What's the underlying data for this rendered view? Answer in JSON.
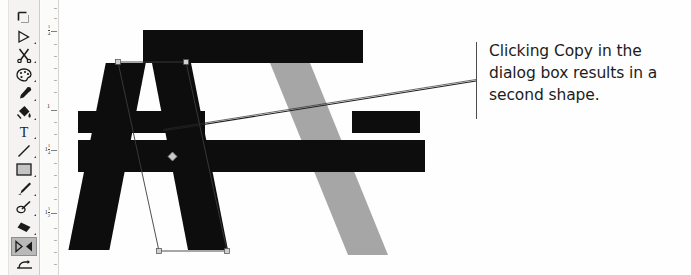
{
  "app": {
    "name": "image-editor-canvas"
  },
  "toolbox": {
    "tools": [
      {
        "id": "crop",
        "icon_name": "crop-icon",
        "label": "Crop",
        "selected": false,
        "has_flyout": false
      },
      {
        "id": "select-shape",
        "icon_name": "pointer-triangle-icon",
        "label": "Shape Select",
        "selected": false,
        "has_flyout": true
      },
      {
        "id": "scissors",
        "icon_name": "scissors-icon",
        "label": "Scissors",
        "selected": false,
        "has_flyout": true
      },
      {
        "id": "palette",
        "icon_name": "palette-icon",
        "label": "Palette",
        "selected": false,
        "has_flyout": true
      },
      {
        "id": "eyedropper",
        "icon_name": "eyedropper-icon",
        "label": "Eyedropper",
        "selected": false,
        "has_flyout": true
      },
      {
        "id": "paint-bucket",
        "icon_name": "paint-bucket-icon",
        "label": "Paint Bucket",
        "selected": false,
        "has_flyout": true
      },
      {
        "id": "text",
        "icon_name": "text-tool-icon",
        "label": "Text",
        "selected": false,
        "has_flyout": true
      },
      {
        "id": "line",
        "icon_name": "line-tool-icon",
        "label": "Line",
        "selected": false,
        "has_flyout": true
      },
      {
        "id": "rectangle",
        "icon_name": "rectangle-tool-icon",
        "label": "Rectangle",
        "selected": false,
        "has_flyout": true
      },
      {
        "id": "brush",
        "icon_name": "paintbrush-icon",
        "label": "Brush",
        "selected": false,
        "has_flyout": true
      },
      {
        "id": "pencil-eraser",
        "icon_name": "pencil-eraser-icon",
        "label": "Pencil",
        "selected": false,
        "has_flyout": true
      },
      {
        "id": "eraser",
        "icon_name": "eraser-icon",
        "label": "Eraser",
        "selected": false,
        "has_flyout": true
      },
      {
        "id": "flip-mirror",
        "icon_name": "flip-mirror-icon",
        "label": "Flip / Mirror",
        "selected": true,
        "has_flyout": false
      },
      {
        "id": "transform",
        "icon_name": "transform-icon",
        "label": "Transform",
        "selected": false,
        "has_flyout": false
      }
    ]
  },
  "ruler": {
    "orientation": "vertical",
    "unit": "inches",
    "labels": [
      {
        "whole": "",
        "num": "1",
        "den": "4",
        "y": 28
      },
      {
        "whole": "1",
        "num": "",
        "den": "",
        "y": 107
      },
      {
        "whole": "1",
        "num": "1",
        "den": "4",
        "y": 147
      },
      {
        "whole": "1",
        "num": "1",
        "den": "2",
        "y": 210
      }
    ]
  },
  "artwork": {
    "original_shape": {
      "name": "black-letter-a-shape",
      "color": "#0d0d0d",
      "description": "Black stylized letter A built from a crossbar and two legs"
    },
    "copied_shape": {
      "name": "gray-diagonal-shape",
      "color": "#a6a6a6",
      "description": "Gray duplicate diagonal stroke offset down and to the right"
    },
    "selection": {
      "name": "selection-outline",
      "color": "#2b2b2b",
      "center_handle_color": "#bfbfbf"
    }
  },
  "callout": {
    "text": "Clicking Copy in the dialog box results in a second shape.",
    "rule_color": "#4d4d4d",
    "leader_color": "#1f1f1f"
  }
}
